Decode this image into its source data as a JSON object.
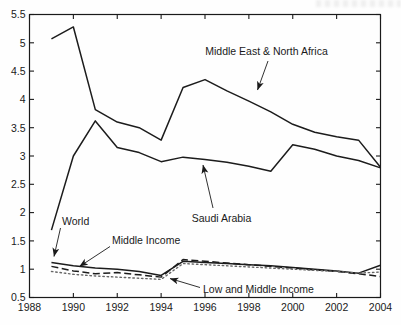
{
  "figure": {
    "background": "#fefefe",
    "axis_color": "#1a1a1a",
    "text_color": "#1a1a1a"
  },
  "chart_data": {
    "type": "line",
    "title": "",
    "xlabel": "",
    "ylabel": "",
    "xlim": [
      1988,
      2004
    ],
    "ylim": [
      0.5,
      5.5
    ],
    "xticks": [
      1988,
      1990,
      1992,
      1994,
      1996,
      1998,
      2000,
      2002,
      2004
    ],
    "yticks": [
      0.5,
      1,
      1.5,
      2,
      2.5,
      3,
      3.5,
      4,
      4.5,
      5,
      5.5
    ],
    "grid": false,
    "legend_position": "none (labels drawn as arrow annotations inside plot)",
    "x": [
      1989,
      1990,
      1991,
      1992,
      1993,
      1994,
      1995,
      1996,
      1997,
      1998,
      1999,
      2000,
      2001,
      2002,
      2003,
      2004
    ],
    "series": [
      {
        "name": "Middle East & North Africa",
        "style": "solid",
        "color": "#1c1c1c",
        "values": [
          5.07,
          5.28,
          3.82,
          3.6,
          3.5,
          3.28,
          4.21,
          4.35,
          4.15,
          3.97,
          3.78,
          3.56,
          3.42,
          3.34,
          3.28,
          2.8
        ]
      },
      {
        "name": "Saudi Arabia",
        "style": "solid",
        "color": "#1c1c1c",
        "values": [
          1.69,
          3.0,
          3.62,
          3.15,
          3.06,
          2.9,
          2.98,
          2.94,
          2.89,
          2.82,
          2.73,
          3.2,
          3.12,
          3.0,
          2.92,
          2.79
        ]
      },
      {
        "name": "World",
        "style": "solid",
        "color": "#1c1c1c",
        "values": [
          1.12,
          1.06,
          1.02,
          1.0,
          0.96,
          0.89,
          1.14,
          1.12,
          1.1,
          1.08,
          1.06,
          1.03,
          1.0,
          0.97,
          0.93,
          1.07
        ]
      },
      {
        "name": "Middle Income",
        "style": "dashed",
        "color": "#1c1c1c",
        "values": [
          1.05,
          0.97,
          0.92,
          0.94,
          0.9,
          0.86,
          1.17,
          1.14,
          1.11,
          1.08,
          1.05,
          1.02,
          0.99,
          0.96,
          0.92,
          0.87
        ]
      },
      {
        "name": "Low and Middle Income",
        "style": "dotted",
        "color": "#666666",
        "values": [
          0.96,
          0.91,
          0.88,
          0.86,
          0.84,
          0.82,
          1.1,
          1.08,
          1.06,
          1.04,
          1.02,
          1.0,
          0.98,
          0.96,
          0.93,
          0.95
        ]
      }
    ],
    "annotations": [
      {
        "label": "Middle East & North Africa",
        "anchor": "middle",
        "text_px": [
          266.5,
          55
        ],
        "arrow_from_px": [
          268,
          61
        ],
        "arrow_to_px": [
          257.5,
          90
        ]
      },
      {
        "label": "Saudi Arabia",
        "anchor": "middle",
        "text_px": [
          221.5,
          222
        ],
        "arrow_from_px": [
          213,
          208
        ],
        "arrow_to_px": [
          203,
          165
        ]
      },
      {
        "label": "World",
        "anchor": "start",
        "text_px": [
          62,
          225
        ],
        "arrow_from_px": [
          60.5,
          228
        ],
        "arrow_to_px": [
          54,
          256.5
        ]
      },
      {
        "label": "Middle Income",
        "anchor": "start",
        "text_px": [
          112,
          244
        ],
        "arrow_from_px": [
          110,
          246.5
        ],
        "arrow_to_px": [
          79.5,
          266.5
        ]
      },
      {
        "label": "Low and Middle Income",
        "anchor": "start",
        "text_px": [
          203,
          292.5
        ],
        "arrow_from_px": [
          200,
          287.5
        ],
        "arrow_to_px": [
          170,
          278.5
        ]
      }
    ]
  }
}
